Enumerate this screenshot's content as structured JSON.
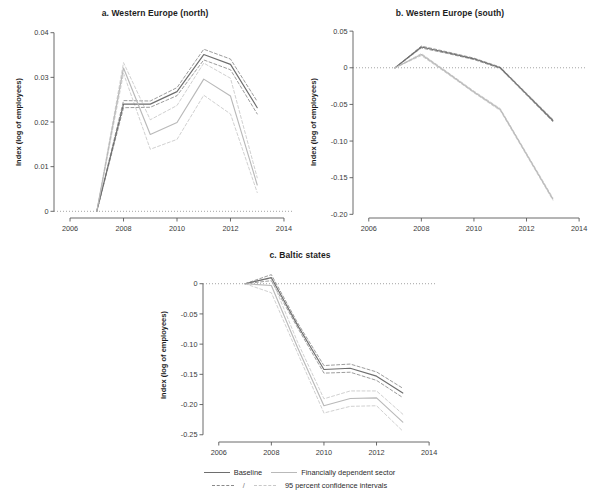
{
  "figure": {
    "background": "#ffffff",
    "ylabel": "Index (log of employees)",
    "colors": {
      "baseline": "#6e6e6e",
      "fin_dep": "#b9b9b9",
      "baseline_ci": "#8a8a8a",
      "fin_dep_ci": "#c8c8c8",
      "axis": "#5a5a5a",
      "zero_line": "#9a9a9a"
    }
  },
  "legend": {
    "baseline_label": "Baseline",
    "fin_dep_label": "Financially dependent sector",
    "separator": "/",
    "ci_label": "95 percent confidence intervals"
  },
  "chart_data": [
    {
      "type": "line",
      "panel": "a",
      "title": "a. Western Europe (north)",
      "xlabel": "",
      "ylabel": "Index (log of employees)",
      "x": [
        2007,
        2008,
        2009,
        2010,
        2011,
        2012,
        2013
      ],
      "xlim": [
        2005.4,
        2014.3
      ],
      "ylim": [
        -0.0015,
        0.0415
      ],
      "xticks": [
        2006,
        2008,
        2010,
        2012,
        2014
      ],
      "xticklabels": [
        "2006",
        "2008",
        "2010",
        "2012",
        "2014"
      ],
      "yticks": [
        0,
        0.01,
        0.02,
        0.03,
        0.04
      ],
      "yticklabels": [
        "0",
        "0.01",
        "0.02",
        "0.03",
        "0.04"
      ],
      "grid": false,
      "zero_line": 0,
      "series": [
        {
          "name": "Baseline",
          "style": "solid",
          "color": "#6e6e6e",
          "values": [
            0,
            0.024,
            0.024,
            0.0268,
            0.0351,
            0.0329,
            0.0232
          ]
        },
        {
          "name": "Baseline upper 95% CI",
          "style": "dashed",
          "color": "#8a8a8a",
          "values": [
            0,
            0.0248,
            0.0247,
            0.0277,
            0.0363,
            0.0341,
            0.0246
          ]
        },
        {
          "name": "Baseline lower 95% CI",
          "style": "dashed",
          "color": "#8a8a8a",
          "values": [
            0,
            0.0232,
            0.0233,
            0.0259,
            0.0339,
            0.0317,
            0.0218
          ]
        },
        {
          "name": "Financially dependent sector",
          "style": "solid",
          "color": "#b9b9b9",
          "values": [
            0,
            0.0321,
            0.0172,
            0.0199,
            0.0296,
            0.0258,
            0.0059
          ]
        },
        {
          "name": "Financially dependent sector upper 95% CI",
          "style": "dashed",
          "color": "#c8c8c8",
          "values": [
            0,
            0.0333,
            0.0205,
            0.0237,
            0.0332,
            0.0298,
            0.0075
          ]
        },
        {
          "name": "Financially dependent sector lower 95% CI",
          "style": "dashed",
          "color": "#c8c8c8",
          "values": [
            0,
            0.0309,
            0.0139,
            0.0161,
            0.026,
            0.0218,
            0.0042
          ]
        }
      ]
    },
    {
      "type": "line",
      "panel": "b",
      "title": "b. Western Europe (south)",
      "xlabel": "",
      "ylabel": "Index (log of employees)",
      "x": [
        2007,
        2008,
        2009,
        2010,
        2011,
        2012,
        2013
      ],
      "xlim": [
        2005.4,
        2014.3
      ],
      "ylim": [
        -0.205,
        0.057
      ],
      "xticks": [
        2006,
        2008,
        2010,
        2012,
        2014
      ],
      "xticklabels": [
        "2006",
        "2008",
        "2010",
        "2012",
        "2014"
      ],
      "yticks": [
        0.05,
        0,
        -0.05,
        -0.1,
        -0.15,
        -0.2
      ],
      "yticklabels": [
        "0.05",
        "0",
        "-0.05",
        "-0.10",
        "-0.15",
        "-0.20"
      ],
      "grid": false,
      "zero_line": 0,
      "series": [
        {
          "name": "Baseline",
          "style": "solid",
          "color": "#6e6e6e",
          "values": [
            0.0,
            0.0283,
            0.0205,
            0.0122,
            0.0,
            -0.036,
            -0.072
          ]
        },
        {
          "name": "Baseline upper 95% CI",
          "style": "dashed",
          "color": "#8a8a8a",
          "values": [
            0.0,
            0.0296,
            0.0216,
            0.0132,
            0.001,
            -0.0348,
            -0.0705
          ]
        },
        {
          "name": "Baseline lower 95% CI",
          "style": "dashed",
          "color": "#8a8a8a",
          "values": [
            0.0,
            0.027,
            0.0194,
            0.0112,
            -0.001,
            -0.0372,
            -0.0735
          ]
        },
        {
          "name": "Financially dependent sector",
          "style": "solid",
          "color": "#b9b9b9",
          "values": [
            0.0,
            0.018,
            -0.0072,
            -0.033,
            -0.057,
            -0.118,
            -0.179
          ]
        },
        {
          "name": "Financially dependent sector upper 95% CI",
          "style": "dashed",
          "color": "#c8c8c8",
          "values": [
            0.0,
            0.0194,
            -0.006,
            -0.0318,
            -0.0556,
            -0.1166,
            -0.1774
          ]
        },
        {
          "name": "Financially dependent sector lower 95% CI",
          "style": "dashed",
          "color": "#c8c8c8",
          "values": [
            0.0,
            0.0166,
            -0.0084,
            -0.0342,
            -0.0584,
            -0.1194,
            -0.1806
          ]
        }
      ]
    },
    {
      "type": "line",
      "panel": "c",
      "title": "c. Baltic states",
      "xlabel": "",
      "ylabel": "Index (log of employees)",
      "x": [
        2007,
        2008,
        2009,
        2010,
        2011,
        2012,
        2013
      ],
      "xlim": [
        2005.4,
        2014.3
      ],
      "ylim": [
        -0.262,
        0.026
      ],
      "xticks": [
        2006,
        2008,
        2010,
        2012,
        2014
      ],
      "xticklabels": [
        "2006",
        "2008",
        "2010",
        "2012",
        "2014"
      ],
      "yticks": [
        0,
        -0.05,
        -0.1,
        -0.15,
        -0.2,
        -0.25
      ],
      "yticklabels": [
        "0",
        "-0.05",
        "-0.10",
        "-0.15",
        "-0.20",
        "-0.25"
      ],
      "grid": false,
      "zero_line": 0,
      "series": [
        {
          "name": "Baseline",
          "style": "solid",
          "color": "#6e6e6e",
          "values": [
            0.0,
            0.01,
            -0.069,
            -0.142,
            -0.14,
            -0.153,
            -0.181
          ]
        },
        {
          "name": "Baseline upper 95% CI",
          "style": "dashed",
          "color": "#8a8a8a",
          "values": [
            0.0,
            0.015,
            -0.065,
            -0.1355,
            -0.133,
            -0.146,
            -0.173
          ]
        },
        {
          "name": "Baseline lower 95% CI",
          "style": "dashed",
          "color": "#8a8a8a",
          "values": [
            0.0,
            0.005,
            -0.073,
            -0.148,
            -0.1465,
            -0.16,
            -0.1885
          ]
        },
        {
          "name": "Financially dependent sector",
          "style": "solid",
          "color": "#b9b9b9",
          "values": [
            0.0,
            -0.003,
            -0.106,
            -0.202,
            -0.19,
            -0.189,
            -0.229
          ]
        },
        {
          "name": "Financially dependent sector upper 95% CI",
          "style": "dashed",
          "color": "#c8c8c8",
          "values": [
            0.0,
            0.009,
            -0.097,
            -0.1905,
            -0.1775,
            -0.1775,
            -0.216
          ]
        },
        {
          "name": "Financially dependent sector lower 95% CI",
          "style": "dashed",
          "color": "#c8c8c8",
          "values": [
            0.0,
            -0.015,
            -0.115,
            -0.214,
            -0.203,
            -0.202,
            -0.244
          ]
        }
      ]
    }
  ]
}
